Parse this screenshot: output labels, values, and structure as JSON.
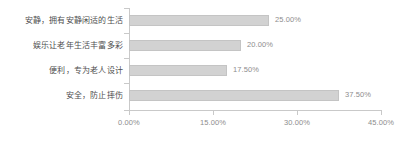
{
  "chart_data": {
    "type": "bar",
    "orientation": "horizontal",
    "title": "",
    "xlabel": "",
    "ylabel": "",
    "categories": [
      "安静，拥有安静闲适的生活",
      "娱乐让老年生活丰富多彩",
      "便利，专为老人设计",
      "安全，防止摔伤"
    ],
    "values": [
      25.0,
      20.0,
      17.5,
      37.5
    ],
    "value_labels": [
      "25.00%",
      "20.00%",
      "17.50%",
      "37.50%"
    ],
    "xlim": [
      0,
      45
    ],
    "xticks": [
      0,
      15,
      30,
      45
    ],
    "xtick_labels": [
      "0.00%",
      "15.00%",
      "30.00%",
      "45.00%"
    ],
    "grid": false,
    "legend": null,
    "colors": {
      "bar_fill": "#d2d2d2",
      "bar_border": "#c4c4c4",
      "axis": "#c9c9c9",
      "category_text": "#4f4f4f",
      "value_text": "#8d8d8d",
      "tick_text": "#8d8d8d",
      "background": "#ffffff"
    }
  }
}
